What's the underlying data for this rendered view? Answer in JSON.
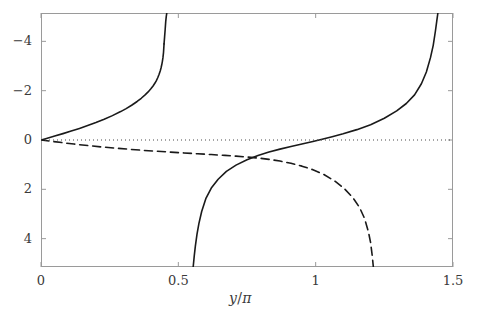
{
  "figure": {
    "width": 481,
    "height": 319,
    "background": "#ffffff",
    "axis_color": "#9a9a9a",
    "curve_color": "#1a1a1a",
    "tick_text_color": "#3a3a3a"
  },
  "axes": {
    "x_title": "y/π",
    "x_title_numerator": "y",
    "x_title_slash": "/",
    "x_title_denominator": "π",
    "y_title": "",
    "x_ticks": [
      "0",
      "0.5",
      "1",
      "1.5"
    ],
    "y_ticks": [
      "4",
      "2",
      "0",
      "−2",
      "−4"
    ],
    "xlim": [
      0,
      1.5
    ],
    "ylim": [
      -5.15,
      5.15
    ],
    "box": {
      "left": 41,
      "top": 13,
      "right": 453,
      "bottom": 267
    }
  },
  "chart_data": {
    "type": "line",
    "title": "",
    "xlabel": "y/π",
    "ylabel": "",
    "xlim": [
      0,
      1.5
    ],
    "ylim": [
      -5.15,
      5.15
    ],
    "xticks": [
      0,
      0.5,
      1,
      1.5
    ],
    "yticks": [
      -4,
      -2,
      0,
      2,
      4
    ],
    "grid": false,
    "legend": "none",
    "series": [
      {
        "name": "solid-curve-branch-1",
        "style": "solid",
        "color": "#1a1a1a",
        "x": [
          0.0,
          0.02,
          0.05,
          0.08,
          0.11,
          0.14,
          0.17,
          0.2,
          0.23,
          0.26,
          0.29,
          0.31,
          0.33,
          0.35,
          0.365,
          0.38,
          0.39,
          0.4,
          0.408,
          0.415,
          0.42,
          0.425,
          0.43,
          0.434,
          0.437,
          0.44,
          0.442,
          0.444,
          0.446,
          0.448
        ],
        "y": [
          0.0,
          0.063,
          0.16,
          0.259,
          0.363,
          0.471,
          0.586,
          0.709,
          0.842,
          0.988,
          1.152,
          1.273,
          1.408,
          1.562,
          1.692,
          1.84,
          1.95,
          2.075,
          2.19,
          2.31,
          2.41,
          2.525,
          2.665,
          2.8,
          2.92,
          3.07,
          3.19,
          3.34,
          3.54,
          3.9
        ]
      },
      {
        "name": "solid-curve-branch-1-tail",
        "style": "solid",
        "color": "#1a1a1a",
        "x": [
          0.448,
          0.45,
          0.452,
          0.454,
          0.456,
          0.458
        ],
        "y": [
          3.9,
          4.18,
          4.47,
          4.79,
          5.0,
          5.15
        ]
      },
      {
        "name": "solid-curve-branch-2",
        "style": "solid",
        "color": "#1a1a1a",
        "x": [
          0.554,
          0.558,
          0.562,
          0.568,
          0.575,
          0.585,
          0.6,
          0.62,
          0.645,
          0.675,
          0.71,
          0.75,
          0.79,
          0.83,
          0.87,
          0.91,
          0.95,
          0.99,
          1.02,
          1.06,
          1.1,
          1.15,
          1.2,
          1.25,
          1.295,
          1.33,
          1.36,
          1.385,
          1.403,
          1.418,
          1.428,
          1.436,
          1.441,
          1.445
        ],
        "y": [
          -5.15,
          -4.7,
          -4.3,
          -3.82,
          -3.38,
          -2.9,
          -2.38,
          -1.95,
          -1.59,
          -1.275,
          -1.02,
          -0.8,
          -0.63,
          -0.49,
          -0.37,
          -0.26,
          -0.16,
          -0.06,
          0.02,
          0.13,
          0.25,
          0.42,
          0.62,
          0.88,
          1.18,
          1.48,
          1.83,
          2.28,
          2.76,
          3.34,
          3.84,
          4.42,
          4.83,
          5.15
        ]
      },
      {
        "name": "dashed-curve",
        "style": "dashed",
        "color": "#1a1a1a",
        "x": [
          0.0,
          0.04,
          0.08,
          0.12,
          0.17,
          0.22,
          0.27,
          0.32,
          0.37,
          0.42,
          0.47,
          0.52,
          0.57,
          0.62,
          0.67,
          0.71,
          0.75,
          0.79,
          0.83,
          0.87,
          0.91,
          0.95,
          0.99,
          1.03,
          1.07,
          1.105,
          1.135,
          1.16,
          1.178,
          1.192,
          1.2,
          1.206,
          1.21
        ],
        "y": [
          0.0,
          -0.055,
          -0.11,
          -0.165,
          -0.225,
          -0.282,
          -0.33,
          -0.375,
          -0.418,
          -0.455,
          -0.492,
          -0.525,
          -0.558,
          -0.59,
          -0.625,
          -0.655,
          -0.69,
          -0.73,
          -0.785,
          -0.855,
          -0.945,
          -1.06,
          -1.205,
          -1.4,
          -1.67,
          -1.98,
          -2.33,
          -2.74,
          -3.18,
          -3.72,
          -4.16,
          -4.7,
          -5.15
        ]
      },
      {
        "name": "zero-reference-line",
        "style": "dotted",
        "color": "#4a4a4a",
        "x": [
          0.0,
          1.5
        ],
        "y": [
          0.0,
          0.0
        ]
      }
    ],
    "annotations": []
  }
}
